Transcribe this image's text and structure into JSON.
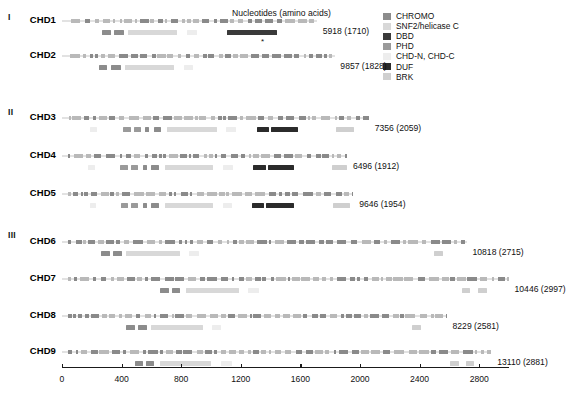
{
  "figure": {
    "axis_title": "Nucleotides (amino acids)",
    "star_marker": "*"
  },
  "legend": {
    "items": [
      {
        "label": "CHROMO",
        "color": "#8c8c8c"
      },
      {
        "label": "SNF2/helicase C",
        "color": "#d8d8d8"
      },
      {
        "label": "DBD",
        "color": "#3a3a3a"
      },
      {
        "label": "PHD",
        "color": "#9a9a9a"
      },
      {
        "label": "CHD-N, CHD-C",
        "color": "#ededed"
      },
      {
        "label": "DUF",
        "color": "#2b2b2b"
      },
      {
        "label": "BRK",
        "color": "#cfcfcf"
      }
    ]
  },
  "axis": {
    "ticks": [
      "0",
      "400",
      "800",
      "1200",
      "1600",
      "2000",
      "2400",
      "2800"
    ],
    "min": 0,
    "max": 3000
  },
  "groups": [
    {
      "numeral": "I",
      "top": 12
    },
    {
      "numeral": "II",
      "top": 107
    },
    {
      "numeral": "III",
      "top": 230
    }
  ],
  "chart_data": {
    "type": "table",
    "xlabel": "Nucleotides (amino acids)",
    "xlim": [
      0,
      3000
    ],
    "categories": [
      "CHD1",
      "CHD2",
      "CHD3",
      "CHD4",
      "CHD5",
      "CHD6",
      "CHD7",
      "CHD8",
      "CHD9"
    ],
    "values": [
      5918,
      9857,
      7356,
      6496,
      9646,
      10818,
      10446,
      8229,
      13110
    ],
    "amino_acids": [
      1710,
      1828,
      2059,
      1912,
      1954,
      2715,
      2997,
      2581,
      2881
    ]
  },
  "proteins": [
    {
      "name": "CHD1",
      "group": "I",
      "count_label": "5918 (1710)",
      "nucleotides": 5918,
      "amino_acids": 1710,
      "gene_start": 60,
      "gene_end": 1710,
      "domains": [
        {
          "type": "CHROMO",
          "start": 270,
          "end": 330
        },
        {
          "type": "CHROMO",
          "start": 350,
          "end": 415
        },
        {
          "type": "SNF2/helicase C",
          "start": 440,
          "end": 775
        },
        {
          "type": "CHD-N, CHD-C",
          "start": 840,
          "end": 905
        },
        {
          "type": "DBD",
          "start": 1105,
          "end": 1440
        }
      ]
    },
    {
      "name": "CHD2",
      "group": "I",
      "count_label": "9857 (1828)",
      "nucleotides": 9857,
      "amino_acids": 1828,
      "gene_start": 55,
      "gene_end": 1830,
      "domains": [
        {
          "type": "CHROMO",
          "start": 245,
          "end": 305
        },
        {
          "type": "CHROMO",
          "start": 330,
          "end": 395
        },
        {
          "type": "SNF2/helicase C",
          "start": 420,
          "end": 755
        },
        {
          "type": "CHD-N, CHD-C",
          "start": 820,
          "end": 880
        }
      ]
    },
    {
      "name": "CHD3",
      "group": "II",
      "count_label": "7356 (2059)",
      "nucleotides": 7356,
      "amino_acids": 2059,
      "gene_start": 45,
      "gene_end": 2059,
      "domains": [
        {
          "type": "CHD-N, CHD-C",
          "start": 190,
          "end": 235
        },
        {
          "type": "PHD",
          "start": 410,
          "end": 460
        },
        {
          "type": "PHD",
          "start": 480,
          "end": 530
        },
        {
          "type": "CHROMO",
          "start": 560,
          "end": 585
        },
        {
          "type": "CHROMO",
          "start": 615,
          "end": 665
        },
        {
          "type": "SNF2/helicase C",
          "start": 705,
          "end": 1040
        },
        {
          "type": "CHD-N, CHD-C",
          "start": 1100,
          "end": 1165
        },
        {
          "type": "DUF",
          "start": 1310,
          "end": 1390
        },
        {
          "type": "DUF",
          "start": 1400,
          "end": 1585
        },
        {
          "type": "BRK",
          "start": 1840,
          "end": 1960
        }
      ]
    },
    {
      "name": "CHD4",
      "group": "II",
      "count_label": "6496 (1912)",
      "nucleotides": 6496,
      "amino_acids": 1912,
      "gene_start": 40,
      "gene_end": 1915,
      "domains": [
        {
          "type": "CHD-N, CHD-C",
          "start": 175,
          "end": 220
        },
        {
          "type": "PHD",
          "start": 390,
          "end": 440
        },
        {
          "type": "PHD",
          "start": 460,
          "end": 510
        },
        {
          "type": "CHROMO",
          "start": 545,
          "end": 570
        },
        {
          "type": "CHROMO",
          "start": 600,
          "end": 650
        },
        {
          "type": "SNF2/helicase C",
          "start": 690,
          "end": 1015
        },
        {
          "type": "CHD-N, CHD-C",
          "start": 1080,
          "end": 1145
        },
        {
          "type": "DUF",
          "start": 1280,
          "end": 1370
        },
        {
          "type": "DUF",
          "start": 1380,
          "end": 1560
        },
        {
          "type": "BRK",
          "start": 1810,
          "end": 1912
        }
      ]
    },
    {
      "name": "CHD5",
      "group": "II",
      "count_label": "9646 (1954)",
      "nucleotides": 9646,
      "amino_acids": 1954,
      "gene_start": 40,
      "gene_end": 1955,
      "domains": [
        {
          "type": "CHD-N, CHD-C",
          "start": 185,
          "end": 230
        },
        {
          "type": "PHD",
          "start": 395,
          "end": 445
        },
        {
          "type": "PHD",
          "start": 465,
          "end": 510
        },
        {
          "type": "CHROMO",
          "start": 545,
          "end": 570
        },
        {
          "type": "CHROMO",
          "start": 600,
          "end": 650
        },
        {
          "type": "SNF2/helicase C",
          "start": 690,
          "end": 1015
        },
        {
          "type": "CHD-N, CHD-C",
          "start": 1080,
          "end": 1140
        },
        {
          "type": "DUF",
          "start": 1275,
          "end": 1355
        },
        {
          "type": "DUF",
          "start": 1370,
          "end": 1555
        },
        {
          "type": "BRK",
          "start": 1820,
          "end": 1930
        }
      ]
    },
    {
      "name": "CHD6",
      "group": "III",
      "count_label": "10818 (2715)",
      "nucleotides": 10818,
      "amino_acids": 2715,
      "gene_start": 40,
      "gene_end": 2715,
      "domains": [
        {
          "type": "CHROMO",
          "start": 265,
          "end": 320
        },
        {
          "type": "CHROMO",
          "start": 340,
          "end": 400
        },
        {
          "type": "SNF2/helicase C",
          "start": 430,
          "end": 790
        },
        {
          "type": "CHD-N, CHD-C",
          "start": 855,
          "end": 920
        },
        {
          "type": "BRK",
          "start": 2495,
          "end": 2560
        }
      ]
    },
    {
      "name": "CHD7",
      "group": "III",
      "count_label": "10446 (2997)",
      "nucleotides": 10446,
      "amino_acids": 2997,
      "gene_start": 40,
      "gene_end": 2997,
      "domains": [
        {
          "type": "CHROMO",
          "start": 660,
          "end": 715
        },
        {
          "type": "CHROMO",
          "start": 735,
          "end": 795
        },
        {
          "type": "SNF2/helicase C",
          "start": 830,
          "end": 1190
        },
        {
          "type": "CHD-N, CHD-C",
          "start": 1250,
          "end": 1320
        },
        {
          "type": "BRK",
          "start": 2685,
          "end": 2740
        },
        {
          "type": "BRK",
          "start": 2790,
          "end": 2850
        }
      ]
    },
    {
      "name": "CHD8",
      "group": "III",
      "count_label": "8229 (2581)",
      "nucleotides": 8229,
      "amino_acids": 2581,
      "gene_start": 40,
      "gene_end": 2581,
      "domains": [
        {
          "type": "CHROMO",
          "start": 430,
          "end": 490
        },
        {
          "type": "CHROMO",
          "start": 510,
          "end": 570
        },
        {
          "type": "SNF2/helicase C",
          "start": 600,
          "end": 945
        },
        {
          "type": "CHD-N, CHD-C",
          "start": 1010,
          "end": 1070
        },
        {
          "type": "BRK",
          "start": 2350,
          "end": 2410
        }
      ]
    },
    {
      "name": "CHD9",
      "group": "III",
      "count_label": "13110 (2881)",
      "nucleotides": 13110,
      "amino_acids": 2881,
      "gene_start": 40,
      "gene_end": 2881,
      "domains": [
        {
          "type": "CHROMO",
          "start": 490,
          "end": 545
        },
        {
          "type": "CHROMO",
          "start": 565,
          "end": 620
        },
        {
          "type": "SNF2/helicase C",
          "start": 655,
          "end": 1000
        },
        {
          "type": "CHD-N, CHD-C",
          "start": 1070,
          "end": 1140
        },
        {
          "type": "BRK",
          "start": 2605,
          "end": 2665
        },
        {
          "type": "BRK",
          "start": 2710,
          "end": 2765
        }
      ]
    }
  ]
}
